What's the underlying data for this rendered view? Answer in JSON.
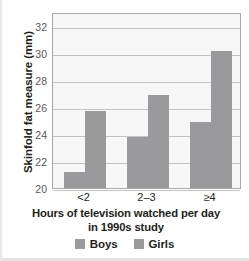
{
  "chart_data": {
    "type": "bar",
    "title": "",
    "categories": [
      "<2",
      "2–3",
      "≥4"
    ],
    "series": [
      {
        "name": "Boys",
        "values": [
          21.2,
          23.8,
          24.9
        ]
      },
      {
        "name": "Girls",
        "values": [
          25.7,
          26.9,
          30.1
        ]
      }
    ],
    "xlabel": "Hours of television watched per day in 1990s study",
    "xlabel_lines": [
      "Hours of television watched per day",
      "in 1990s study"
    ],
    "ylabel": "Skinfold fat measure (mm)",
    "ylim": [
      20,
      33
    ],
    "yticks": [
      20,
      22,
      24,
      26,
      28,
      30,
      32
    ],
    "ytick_labels": [
      "20",
      "22",
      "24",
      "26",
      "28",
      "30",
      "32"
    ],
    "grid": "horizontal",
    "legend_position": "bottom",
    "legend": [
      "Boys",
      "Girls"
    ],
    "colors": {
      "bar": "#9a9a9c",
      "plot_background": "#f7f7f8",
      "gridline": "#c3c3c5",
      "plot_border": "#a9a9ab",
      "text": "#231f20",
      "tick_text": "#58585b"
    }
  }
}
